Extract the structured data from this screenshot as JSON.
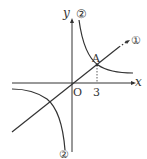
{
  "figure": {
    "type": "coordinate-graph",
    "colors": {
      "stroke": "#333333",
      "background": "#ffffff"
    },
    "axes": {
      "x_label": "x",
      "y_label": "y",
      "origin_label": "O"
    },
    "point": {
      "label": "A",
      "x_value": "3"
    },
    "curves": [
      {
        "id": "line-1",
        "label": "①",
        "kind": "line through origin"
      },
      {
        "id": "hyperbola-2",
        "label": "②",
        "kind": "inverse proportion hyperbola"
      }
    ],
    "labels": {
      "line": "①",
      "hyperbola_top": "②",
      "hyperbola_bottom": "②",
      "x_tick": "3"
    }
  }
}
